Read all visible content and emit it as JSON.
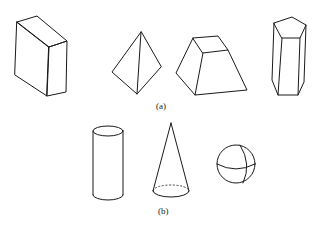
{
  "figure": {
    "panel_a": {
      "label": "(a)",
      "shapes": [
        "rectangular-prism",
        "triangular-pyramid",
        "frustum",
        "pentagonal-prism"
      ]
    },
    "panel_b": {
      "label": "(b)",
      "shapes": [
        "cylinder",
        "cone",
        "sphere"
      ]
    },
    "line_color": "#1a1a1a",
    "background": "#ffffff"
  }
}
